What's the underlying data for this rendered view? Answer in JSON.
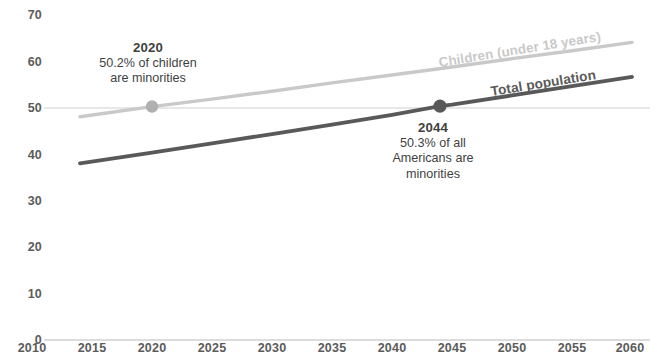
{
  "chart_data": {
    "type": "line",
    "title": "",
    "subtitle": "",
    "xlabel": "",
    "ylabel": "",
    "xlim": [
      2010,
      2060
    ],
    "ylim": [
      0,
      70
    ],
    "grid": "horizontal gridlines at y=0 and y=50 only",
    "legend_position": "inline labels along each line",
    "x_ticks": [
      "2010",
      "2015",
      "2020",
      "2025",
      "2030",
      "2035",
      "2040",
      "2045",
      "2050",
      "2055",
      "2060"
    ],
    "y_ticks": [
      "0",
      "10",
      "20",
      "30",
      "40",
      "50",
      "60",
      "70"
    ],
    "series": [
      {
        "name": "Children (under 18 years)",
        "color": "#c9c9c9",
        "x": [
          2014,
          2020,
          2025,
          2030,
          2035,
          2040,
          2045,
          2050,
          2055,
          2060
        ],
        "values": [
          48.0,
          50.2,
          51.8,
          53.5,
          55.3,
          57.0,
          58.7,
          60.5,
          62.2,
          64.0
        ]
      },
      {
        "name": "Total population",
        "color": "#595959",
        "x": [
          2014,
          2020,
          2025,
          2030,
          2035,
          2040,
          2044,
          2045,
          2050,
          2055,
          2060
        ],
        "values": [
          38.0,
          40.3,
          42.3,
          44.3,
          46.3,
          48.4,
          50.3,
          50.6,
          52.6,
          54.6,
          56.6
        ]
      }
    ],
    "markers": [
      {
        "series": "Children (under 18 years)",
        "x": 2020,
        "y": 50.2,
        "color": "#b0b0b0"
      },
      {
        "series": "Total population",
        "x": 2044,
        "y": 50.3,
        "color": "#595959"
      }
    ],
    "annotations": [
      {
        "id": "annotation-2020",
        "year": "2020",
        "line1": "50.2% of children",
        "line2": "are minorities",
        "points_to": {
          "x": 2020,
          "y": 50.2
        }
      },
      {
        "id": "annotation-2044",
        "year": "2044",
        "line1": "50.3% of all",
        "line2": "Americans are",
        "line3": "minorities",
        "points_to": {
          "x": 2044,
          "y": 50.3
        }
      }
    ]
  },
  "axes": {
    "y_labels": [
      "70",
      "60",
      "50",
      "40",
      "30",
      "20",
      "10",
      "0"
    ],
    "x_labels": [
      "2010",
      "2015",
      "2020",
      "2025",
      "2030",
      "2035",
      "2040",
      "2045",
      "2050",
      "2055",
      "2060"
    ]
  },
  "labels": {
    "children": "Children (under 18 years)",
    "total": "Total population"
  },
  "annotation_2020": {
    "year": "2020",
    "line1": "50.2% of children",
    "line2": "are minorities"
  },
  "annotation_2044": {
    "year": "2044",
    "line1": "50.3% of all",
    "line2": "Americans are",
    "line3": "minorities"
  },
  "colors": {
    "children_line": "#c9c9c9",
    "total_line": "#595959",
    "gridline": "#cfcfcf",
    "tick_text": "#5b5b5b",
    "annotation_text": "#3f3f3f"
  }
}
